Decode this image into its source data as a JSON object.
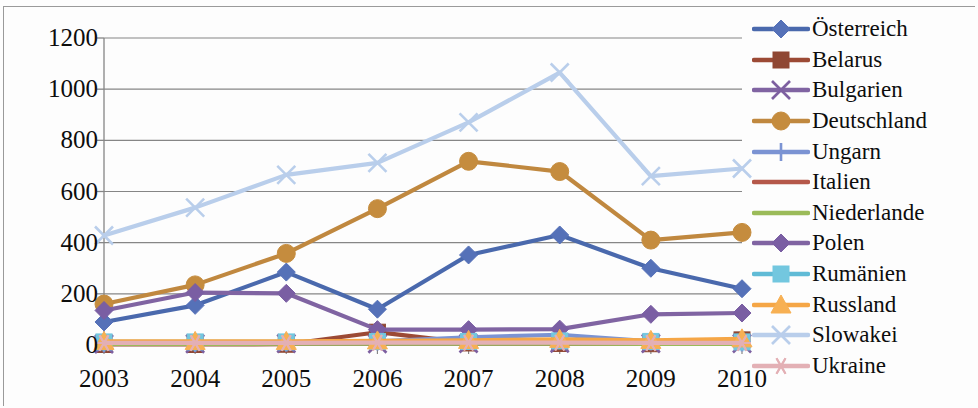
{
  "chart_data": {
    "type": "line",
    "title": "",
    "subtitle": "",
    "xlabel": "",
    "ylabel": "",
    "categories": [
      "2003",
      "2004",
      "2005",
      "2006",
      "2007",
      "2008",
      "2009",
      "2010"
    ],
    "x": [
      2003,
      2004,
      2005,
      2006,
      2007,
      2008,
      2009,
      2010
    ],
    "ylim": [
      0,
      1200
    ],
    "yticks": [
      0,
      200,
      400,
      600,
      800,
      1000,
      1200
    ],
    "ytick_labels": [
      "0",
      "200",
      "400",
      "600",
      "800",
      "1000",
      "1200"
    ],
    "grid": "horizontal",
    "legend_position": "right",
    "series": [
      {
        "name": "Österreich",
        "color": "#4a69ad",
        "marker": "diamond",
        "marker_color": "#5571b8",
        "values": [
          90,
          155,
          285,
          140,
          352,
          430,
          300,
          220
        ]
      },
      {
        "name": "Belarus",
        "color": "#9c4a35",
        "marker": "square",
        "marker_color": "#8f4733",
        "values": [
          2,
          2,
          3,
          50,
          8,
          6,
          5,
          20
        ]
      },
      {
        "name": "Bulgarien",
        "color": "#8064a2",
        "marker": "cross",
        "marker_color": "#7d5fa0",
        "values": [
          4,
          5,
          6,
          5,
          6,
          7,
          6,
          6
        ]
      },
      {
        "name": "Deutschland",
        "color": "#c0883f",
        "marker": "circle",
        "marker_color": "#c58c3e",
        "values": [
          160,
          235,
          358,
          533,
          718,
          678,
          410,
          440
        ]
      },
      {
        "name": "Ungarn",
        "color": "#7b93d3",
        "marker": "plus",
        "marker_color": "#7b93d3",
        "values": [
          6,
          7,
          9,
          14,
          30,
          40,
          14,
          10
        ]
      },
      {
        "name": "Italien",
        "color": "#b5584a",
        "marker": "none",
        "marker_color": "#b5584a",
        "values": [
          5,
          5,
          6,
          6,
          6,
          6,
          5,
          5
        ]
      },
      {
        "name": "Niederlande",
        "color": "#9bbb59",
        "marker": "none",
        "marker_color": "#9bbb59",
        "values": [
          4,
          4,
          5,
          5,
          5,
          5,
          4,
          4
        ]
      },
      {
        "name": "Polen",
        "color": "#8064a2",
        "marker": "diamond",
        "marker_color": "#7a5ea3",
        "values": [
          135,
          205,
          202,
          60,
          60,
          62,
          120,
          125
        ]
      },
      {
        "name": "Rumänien",
        "color": "#60bbd6",
        "marker": "square",
        "marker_color": "#73c7df",
        "values": [
          12,
          12,
          12,
          14,
          14,
          16,
          14,
          12
        ]
      },
      {
        "name": "Russland",
        "color": "#f5a646",
        "marker": "triangle",
        "marker_color": "#f7b053",
        "values": [
          14,
          14,
          14,
          16,
          18,
          22,
          18,
          24
        ]
      },
      {
        "name": "Slowakei",
        "color": "#b9ceeb",
        "marker": "cross",
        "marker_color": "#b9ceeb",
        "values": [
          428,
          537,
          665,
          712,
          870,
          1065,
          660,
          690
        ]
      },
      {
        "name": "Ukraine",
        "color": "#e3b0b5",
        "marker": "asterisk",
        "marker_color": "#e3b0b5",
        "values": [
          8,
          8,
          8,
          9,
          9,
          9,
          8,
          8
        ]
      }
    ]
  },
  "axis": {
    "y_labels": [
      "1200",
      "1000",
      "800",
      "600",
      "400",
      "200",
      "0"
    ],
    "x_labels": [
      "2003",
      "2004",
      "2005",
      "2006",
      "2007",
      "2008",
      "2009",
      "2010"
    ]
  },
  "legend": {
    "items": [
      {
        "label": "Österreich",
        "icon": "diamond-marker-icon"
      },
      {
        "label": "Belarus",
        "icon": "square-marker-icon"
      },
      {
        "label": "Bulgarien",
        "icon": "cross-marker-icon"
      },
      {
        "label": "Deutschland",
        "icon": "circle-marker-icon"
      },
      {
        "label": "Ungarn",
        "icon": "plus-marker-icon"
      },
      {
        "label": "Italien",
        "icon": "line-marker-icon"
      },
      {
        "label": "Niederlande",
        "icon": "line-marker-icon"
      },
      {
        "label": "Polen",
        "icon": "diamond-marker-icon"
      },
      {
        "label": "Rumänien",
        "icon": "square-marker-icon"
      },
      {
        "label": "Russland",
        "icon": "triangle-marker-icon"
      },
      {
        "label": "Slowakei",
        "icon": "cross-marker-icon"
      },
      {
        "label": "Ukraine",
        "icon": "asterisk-marker-icon"
      }
    ]
  }
}
